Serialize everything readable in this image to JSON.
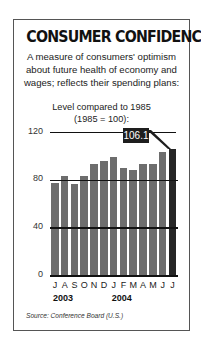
{
  "title": "CONSUMER CONFIDENCE",
  "subtitle_lines": [
    "A measure of consumers' optimism",
    "about future health of economy and",
    "wages; reflects their spending plans:"
  ],
  "unit_lines": [
    "Level compared to 1985",
    "(1985 = 100):"
  ],
  "callout_label": "106.1",
  "source": "Source: Conference Board (U.S.)",
  "colors": {
    "bar": "#6d6d6d",
    "highlight_bar": "#262626",
    "callout_bg": "#1e1e1e",
    "gridline": "#111111"
  },
  "chart_data": {
    "type": "bar",
    "title": "CONSUMER CONFIDENCE",
    "subtitle": "A measure of consumers' optimism about future health of economy and wages; reflects their spending plans: Level compared to 1985 (1985 = 100)",
    "categories": [
      "J",
      "A",
      "S",
      "O",
      "N",
      "D",
      "J",
      "F",
      "M",
      "A",
      "M",
      "J",
      "J"
    ],
    "category_years": [
      "2003",
      "2003",
      "2003",
      "2003",
      "2003",
      "2003",
      "2004",
      "2004",
      "2004",
      "2004",
      "2004",
      "2004",
      "2004"
    ],
    "year_labels": [
      "2003",
      "2004"
    ],
    "values": [
      78,
      84,
      77,
      84,
      94,
      96,
      100,
      90,
      89,
      94,
      94,
      104,
      106.1
    ],
    "xlabel": "",
    "ylabel": "",
    "yticks": [
      0,
      40,
      80,
      120
    ],
    "ylim": [
      0,
      120
    ],
    "grid": true,
    "annotations": [
      {
        "index": 12,
        "label": "106.1"
      }
    ],
    "source": "Source: Conference Board (U.S.)"
  }
}
